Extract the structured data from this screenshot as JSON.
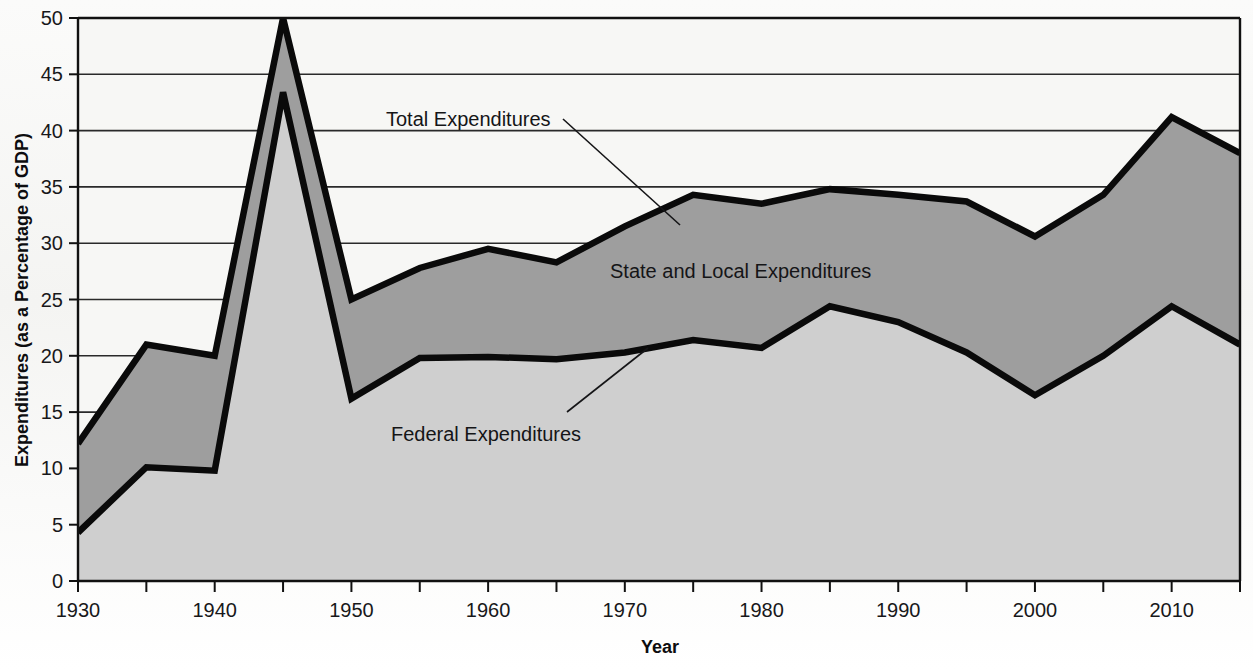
{
  "chart_data": {
    "type": "area",
    "title": "",
    "xlabel": "Year",
    "ylabel": "Expenditures (as a Percentage of GDP)",
    "xlim": [
      1930,
      2015
    ],
    "ylim": [
      0,
      50
    ],
    "grid": true,
    "legend_position": "inline-annotations",
    "x": [
      1930,
      1935,
      1940,
      1945,
      1950,
      1955,
      1960,
      1965,
      1970,
      1975,
      1980,
      1985,
      1990,
      1995,
      2000,
      2005,
      2010,
      2015
    ],
    "xticks_major": [
      "1930",
      "1940",
      "1950",
      "1960",
      "1970",
      "1980",
      "1990",
      "2000",
      "2010"
    ],
    "xtick_values_major": [
      1930,
      1940,
      1950,
      1960,
      1970,
      1980,
      1990,
      2000,
      2010
    ],
    "xtick_values_minor": [
      1935,
      1945,
      1955,
      1965,
      1975,
      1985,
      1995,
      2005,
      2015
    ],
    "yticks": [
      "0",
      "5",
      "10",
      "15",
      "20",
      "25",
      "30",
      "35",
      "40",
      "45",
      "50"
    ],
    "ytick_values": [
      0,
      5,
      10,
      15,
      20,
      25,
      30,
      35,
      40,
      45,
      50
    ],
    "series": [
      {
        "name": "Total Expenditures",
        "values": [
          12.2,
          21.0,
          20.0,
          50.0,
          25.0,
          27.8,
          29.5,
          28.3,
          31.5,
          34.3,
          33.5,
          34.8,
          34.3,
          33.7,
          30.6,
          34.3,
          41.2,
          38.0
        ],
        "fill": "#9e9e9e",
        "line": "#0a0a0a"
      },
      {
        "name": "Federal Expenditures",
        "values": [
          4.3,
          10.1,
          9.8,
          43.4,
          16.2,
          19.8,
          19.9,
          19.7,
          20.3,
          21.4,
          20.7,
          24.4,
          23.0,
          20.3,
          16.5,
          20.0,
          24.4,
          21.0
        ],
        "fill": "#cfcfcf",
        "line": "#0a0a0a"
      }
    ],
    "annotations": [
      {
        "label": "Total Expenditures",
        "text_x": 1930,
        "text_y": 0,
        "leader": true
      },
      {
        "label": "State and Local Expenditures",
        "text_x": 1975,
        "text_y": 27,
        "leader": false
      },
      {
        "label": "Federal Expenditures",
        "text_x": 1957,
        "text_y": 17,
        "leader": true
      }
    ],
    "colors": {
      "total_fill": "#9e9e9e",
      "federal_fill": "#cfcfcf",
      "line": "#0a0a0a",
      "grid": "#2a2a2a",
      "axis": "#111111",
      "background": "#f6f6f4"
    }
  },
  "axes": {
    "y_title": "Expenditures (as a Percentage of GDP)",
    "x_title": "Year"
  },
  "annotations": {
    "total": "Total Expenditures",
    "state_local": "State and Local Expenditures",
    "federal": "Federal Expenditures"
  }
}
